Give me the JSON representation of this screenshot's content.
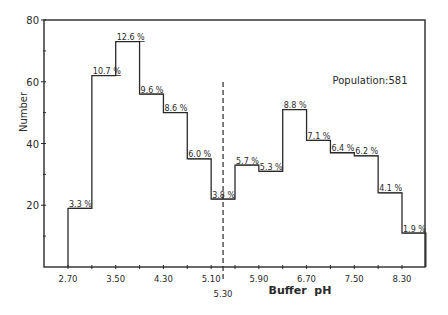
{
  "chart_data": {
    "type": "bar",
    "subtype": "histogram",
    "title": "",
    "xlabel": "Buffer  pH",
    "ylabel": "Number",
    "annotation": "Population:581",
    "population": 581,
    "ylim": [
      0,
      80
    ],
    "yticks": [
      20,
      40,
      60,
      80
    ],
    "yminor_ticks": [
      10,
      30,
      50,
      70
    ],
    "xlim": [
      2.3,
      8.7
    ],
    "xtick_labels": [
      "2.70",
      "3.50",
      "4.30",
      "5.10",
      "5.90",
      "6.70",
      "7.50",
      "8.30"
    ],
    "xticks": [
      2.7,
      3.5,
      4.3,
      5.1,
      5.9,
      6.7,
      7.5,
      8.3
    ],
    "xminor_ticks": [
      3.1,
      3.9,
      4.7,
      5.5,
      6.3,
      7.1,
      7.9
    ],
    "divider": {
      "x": 5.3,
      "label": "5.30",
      "style": "dashed"
    },
    "bin_width": 0.4,
    "bin_edges": [
      2.7,
      3.1,
      3.5,
      3.9,
      4.3,
      4.7,
      5.1,
      5.5,
      5.9,
      6.3,
      6.7,
      7.1,
      7.5,
      7.9,
      8.3,
      8.7
    ],
    "values": [
      19,
      62,
      73,
      56,
      50,
      35,
      22,
      33,
      31,
      51,
      41,
      37,
      36,
      24,
      11
    ],
    "percent_labels": [
      "3.3 %",
      "10.7 %",
      "12.6 %",
      "9.6 %",
      "8.6 %",
      "6.0 %",
      "3.8 %",
      "5.7 %",
      "5.3 %",
      "8.8 %",
      "7.1 %",
      "6.4 %",
      "6.2 %",
      "4.1 %",
      "1.9 %"
    ],
    "grid": false,
    "legend": null
  }
}
